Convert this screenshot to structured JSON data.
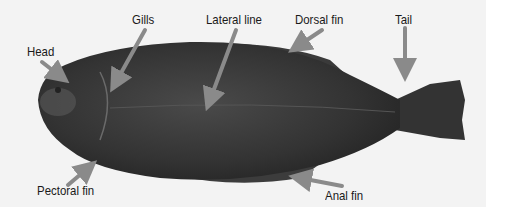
{
  "diagram": {
    "labels": [
      {
        "id": "head",
        "text": "Head",
        "x": 27,
        "y": 44
      },
      {
        "id": "gills",
        "text": "Gills",
        "x": 132,
        "y": 12
      },
      {
        "id": "lateral-line",
        "text": "Lateral line",
        "x": 206,
        "y": 12
      },
      {
        "id": "dorsal-fin",
        "text": "Dorsal fin",
        "x": 295,
        "y": 12
      },
      {
        "id": "tail",
        "text": "Tail",
        "x": 395,
        "y": 12
      },
      {
        "id": "pectoral-fin",
        "text": "Pectoral fin",
        "x": 37,
        "y": 183
      },
      {
        "id": "anal-fin",
        "text": "Anal fin",
        "x": 325,
        "y": 188
      }
    ],
    "colors": {
      "arrow": "#8a8a8a",
      "background": "#f3f3f3",
      "fish_body": "#3a3a3a",
      "label_text": "#1a1a1a"
    }
  }
}
